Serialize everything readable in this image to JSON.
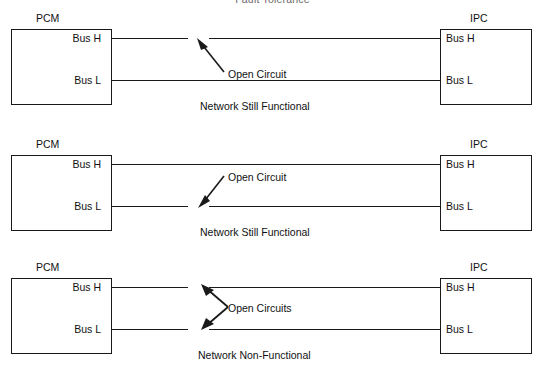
{
  "title": "Fault Tolerance",
  "nodes": {
    "left_label": "PCM",
    "right_label": "IPC",
    "port_high": "Bus H",
    "port_low": "Bus L"
  },
  "panels": [
    {
      "id": "panel-1",
      "left_module": "PCM",
      "right_module": "IPC",
      "left_port_high": "Bus H",
      "left_port_low": "Bus L",
      "right_port_high": "Bus H",
      "right_port_low": "Bus L",
      "fault_label": "Open Circuit",
      "status": "Network Still Functional",
      "broken_line": "Bus H",
      "intact_line": "Bus L",
      "arrow_count": 1,
      "arrow_direction": "up-left"
    },
    {
      "id": "panel-2",
      "left_module": "PCM",
      "right_module": "IPC",
      "left_port_high": "Bus H",
      "left_port_low": "Bus L",
      "right_port_high": "Bus H",
      "right_port_low": "Bus L",
      "fault_label": "Open Circuit",
      "status": "Network Still Functional",
      "broken_line": "Bus L",
      "intact_line": "Bus H",
      "arrow_count": 1,
      "arrow_direction": "down-left"
    },
    {
      "id": "panel-3",
      "left_module": "PCM",
      "right_module": "IPC",
      "left_port_high": "Bus H",
      "left_port_low": "Bus L",
      "right_port_high": "Bus H",
      "right_port_low": "Bus L",
      "fault_label": "Open Circuits",
      "status": "Network Non-Functional",
      "broken_line": "Bus H and Bus L",
      "intact_line": "",
      "arrow_count": 2,
      "arrow_direction": "up-left and down-left"
    }
  ],
  "colors": {
    "stroke": "#1a1a1a",
    "text": "#111111",
    "background": "#ffffff",
    "title_text": "#6a6a6a"
  }
}
